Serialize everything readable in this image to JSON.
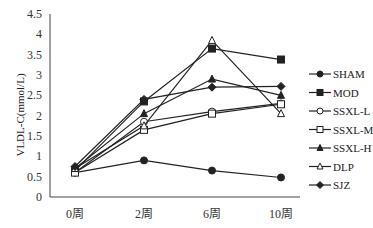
{
  "chart_data": {
    "type": "line",
    "title": "",
    "xlabel": "",
    "ylabel": "VLDL-C(mmol/L)",
    "categories": [
      "0周",
      "2周",
      "6周",
      "10周"
    ],
    "ylim": [
      0,
      4.5
    ],
    "yticks": [
      "0",
      "0.5",
      "1",
      "1.5",
      "2",
      "2.5",
      "3",
      "3.5",
      "4",
      "4.5"
    ],
    "grid": false,
    "legend_position": "right",
    "series": [
      {
        "name": "SHAM",
        "marker": "filled-circle",
        "values": [
          0.6,
          0.9,
          0.65,
          0.48
        ]
      },
      {
        "name": "MOD",
        "marker": "filled-square",
        "values": [
          0.65,
          2.35,
          3.65,
          3.38
        ]
      },
      {
        "name": "SSXL-L",
        "marker": "open-circle",
        "values": [
          0.6,
          1.85,
          2.1,
          2.3
        ]
      },
      {
        "name": "SSXL-M",
        "marker": "open-square",
        "values": [
          0.6,
          1.65,
          2.05,
          2.28
        ]
      },
      {
        "name": "SSXL-H",
        "marker": "filled-triangle",
        "values": [
          0.7,
          2.05,
          2.9,
          2.5
        ]
      },
      {
        "name": "DLP",
        "marker": "open-triangle",
        "values": [
          0.7,
          1.75,
          3.85,
          2.05
        ]
      },
      {
        "name": "SJZ",
        "marker": "filled-diamond",
        "values": [
          0.75,
          2.4,
          2.7,
          2.72
        ]
      }
    ]
  }
}
